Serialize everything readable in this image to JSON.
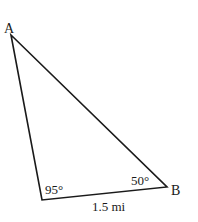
{
  "diagram": {
    "type": "triangle",
    "vertices": {
      "A": {
        "label": "A",
        "x": 11,
        "y": 35
      },
      "C": {
        "label": "",
        "x": 42,
        "y": 200
      },
      "B": {
        "label": "B",
        "x": 167,
        "y": 187
      }
    },
    "angles": {
      "C": "95°",
      "B": "50°"
    },
    "sides": {
      "CB": "1.5 mi"
    },
    "colors": {
      "stroke": "#1a1a1a",
      "background": "#ffffff"
    }
  }
}
